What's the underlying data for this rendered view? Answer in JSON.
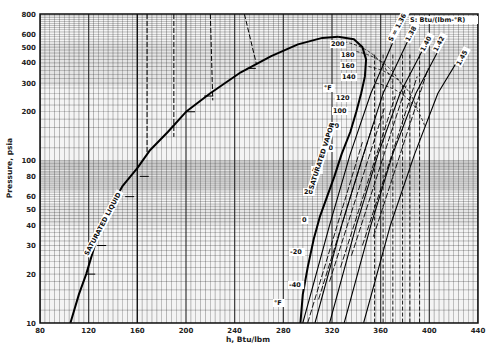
{
  "chart_data": {
    "type": "line",
    "title": "",
    "subtitle": "",
    "xlabel": "h, Btu/lbm",
    "ylabel": "Pressure, psia",
    "xscale": "linear",
    "yscale": "log",
    "xlim": [
      80,
      440
    ],
    "ylim": [
      10,
      800
    ],
    "grid": true,
    "x_ticks": [
      80,
      120,
      160,
      200,
      240,
      280,
      320,
      360,
      400,
      440
    ],
    "y_ticks": [
      10,
      20,
      30,
      40,
      50,
      60,
      80,
      100,
      200,
      300,
      400,
      500,
      600,
      800
    ],
    "legend_position": "none",
    "entropy_units_label": "S: Btu/(lbm-°R)",
    "temperature_unit_label": "°F",
    "series": [
      {
        "name": "Saturated liquid",
        "label": "SATURATED LIQUID",
        "points": [
          [
            105,
            10
          ],
          [
            112,
            15
          ],
          [
            118,
            20
          ],
          [
            125,
            30
          ],
          [
            131,
            40
          ],
          [
            140,
            55
          ],
          [
            148,
            70
          ],
          [
            160,
            90
          ],
          [
            170,
            115
          ],
          [
            185,
            150
          ],
          [
            200,
            200
          ],
          [
            220,
            260
          ],
          [
            245,
            350
          ],
          [
            270,
            440
          ],
          [
            292,
            520
          ],
          [
            312,
            570
          ],
          [
            325,
            580
          ]
        ]
      },
      {
        "name": "Saturated vapor",
        "label": "SATURATED VAPOR",
        "points": [
          [
            325,
            580
          ],
          [
            338,
            560
          ],
          [
            345,
            500
          ],
          [
            348,
            420
          ],
          [
            347,
            330
          ],
          [
            344,
            260
          ],
          [
            340,
            200
          ],
          [
            335,
            150
          ],
          [
            328,
            110
          ],
          [
            322,
            80
          ],
          [
            316,
            60
          ],
          [
            310,
            45
          ],
          [
            305,
            33
          ],
          [
            300,
            22
          ],
          [
            296,
            15
          ],
          [
            294,
            10
          ]
        ]
      },
      {
        "name": "s = 1.36",
        "label": "S = 1.36",
        "points": [
          [
            296,
            10
          ],
          [
            318,
            40
          ],
          [
            335,
            110
          ],
          [
            352,
            260
          ],
          [
            372,
            580
          ]
        ]
      },
      {
        "name": "s = 1.38",
        "label": "1.38",
        "points": [
          [
            306,
            10
          ],
          [
            328,
            40
          ],
          [
            346,
            110
          ],
          [
            362,
            260
          ],
          [
            383,
            560
          ]
        ]
      },
      {
        "name": "s = 1.40",
        "label": "1.40",
        "points": [
          [
            318,
            10
          ],
          [
            340,
            40
          ],
          [
            358,
            110
          ],
          [
            376,
            260
          ],
          [
            398,
            540
          ]
        ]
      },
      {
        "name": "s = 1.42",
        "label": "1.42",
        "points": [
          [
            330,
            10
          ],
          [
            352,
            40
          ],
          [
            370,
            110
          ],
          [
            389,
            260
          ],
          [
            410,
            520
          ]
        ]
      },
      {
        "name": "s = 1.45",
        "label": "1.45",
        "points": [
          [
            346,
            10
          ],
          [
            368,
            40
          ],
          [
            388,
            110
          ],
          [
            407,
            260
          ],
          [
            430,
            500
          ]
        ]
      }
    ],
    "isotherms_F": [
      200,
      180,
      160,
      140,
      120,
      100,
      80,
      60,
      40,
      20,
      0,
      -20,
      -40
    ],
    "isotherm_labels_shown": [
      "200",
      "180",
      "160",
      "140",
      "°F",
      "120",
      "100",
      "80",
      "60",
      "40",
      "20",
      "0",
      "-20",
      "-40",
      "°F"
    ]
  }
}
